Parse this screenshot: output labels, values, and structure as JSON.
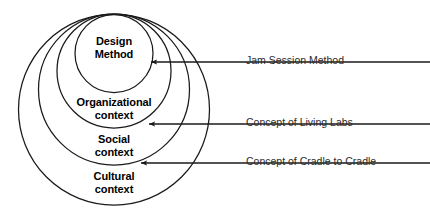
{
  "figure": {
    "type": "nested-circles-venn",
    "background_color": "#ffffff",
    "stroke_color": "#1a1a1a",
    "text_color": "#000000",
    "callout_text_color": "#2b2b2b"
  },
  "circles": [
    {
      "id": "design-method",
      "label_lines": [
        "Design",
        "Method"
      ],
      "level": 1,
      "cx": 114,
      "cy": 53.5,
      "r": 39,
      "label_x": 114,
      "label_y": 35,
      "font_size": 11
    },
    {
      "id": "organizational-context",
      "label_lines": [
        "Organizational",
        "context"
      ],
      "level": 2,
      "cx": 114,
      "cy": 71,
      "r": 57,
      "label_x": 114,
      "label_y": 96,
      "font_size": 11
    },
    {
      "id": "social-context",
      "label_lines": [
        "Social",
        "context"
      ],
      "level": 3,
      "cx": 114,
      "cy": 89.5,
      "r": 75.5,
      "label_x": 114,
      "label_y": 133,
      "font_size": 11
    },
    {
      "id": "cultural-context",
      "label_lines": [
        "Cultural",
        "context"
      ],
      "level": 4,
      "cx": 114,
      "cy": 109.5,
      "r": 95.5,
      "label_x": 114,
      "label_y": 170,
      "font_size": 11
    }
  ],
  "callouts": [
    {
      "id": "jam-session-method",
      "text": "Jam Session Method",
      "arrow_tip_x": 151,
      "arrow_tip_y": 62,
      "line_end_x": 430,
      "line_y": 62,
      "text_x": 246,
      "text_y": 62,
      "font_size": 10.5
    },
    {
      "id": "concept-of-living-labs",
      "text": "Concept of Living Labs",
      "arrow_tip_x": 149,
      "arrow_tip_y": 124,
      "line_end_x": 430,
      "line_y": 124,
      "text_x": 246,
      "text_y": 124,
      "font_size": 10.5
    },
    {
      "id": "concept-of-cradle-to-cradle",
      "text": "Concept of Cradle to Cradle",
      "arrow_tip_x": 141,
      "arrow_tip_y": 163,
      "line_end_x": 430,
      "line_y": 163,
      "text_x": 246,
      "text_y": 163,
      "font_size": 10.5
    }
  ]
}
